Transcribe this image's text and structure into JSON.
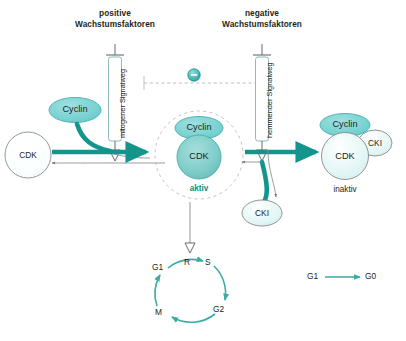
{
  "diagram": {
    "colors": {
      "teal_arrow": "#14958c",
      "teal_thin": "#3aada3",
      "cyclin_fill": "#79d2d2",
      "cdk_active_fill": "#7fcfcb",
      "pale_fill": "#dff3f4",
      "outline": "#6b6b6b",
      "text": "#231f20",
      "active_label": "#0b8f85"
    },
    "headers": {
      "left_line1": "positive",
      "left_line2": "Wachstumsfaktoren",
      "right_line1": "negative",
      "right_line2": "Wachstumsfaktoren"
    },
    "pathways": {
      "left_channel_label": "mitogener Signalweg",
      "right_channel_label": "hemmender Signalweg"
    },
    "inhibition": {
      "symbol": "–",
      "name": "minus-sign"
    },
    "left_group": {
      "cdk_label": "CDK",
      "cyclin_label": "Cyclin"
    },
    "center_group": {
      "cyclin_label": "Cyclin",
      "cdk_label": "CDK",
      "state_label": "aktiv"
    },
    "right_group": {
      "cyclin_label": "Cyclin",
      "cdk_label": "CDK",
      "cki_label": "CKI",
      "state_label": "inaktiv"
    },
    "free_cki": {
      "label": "CKI"
    },
    "cell_cycle": {
      "phases": [
        {
          "label": "G1",
          "x": 160,
          "y": 268
        },
        {
          "label": "R",
          "x": 188,
          "y": 263
        },
        {
          "label": "S",
          "x": 209,
          "y": 263
        },
        {
          "label": "G2",
          "x": 219,
          "y": 310
        },
        {
          "label": "M",
          "x": 161,
          "y": 313
        }
      ]
    },
    "quiescence": {
      "from_label": "G1",
      "to_label": "G0"
    }
  }
}
